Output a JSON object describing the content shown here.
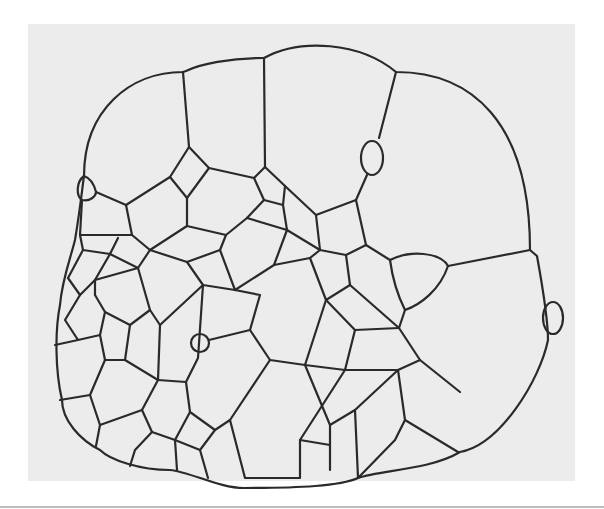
{
  "figure": {
    "background_color": "#ececec",
    "page_color": "#ffffff",
    "edge_color": "#2a2a2a",
    "caption": ""
  }
}
